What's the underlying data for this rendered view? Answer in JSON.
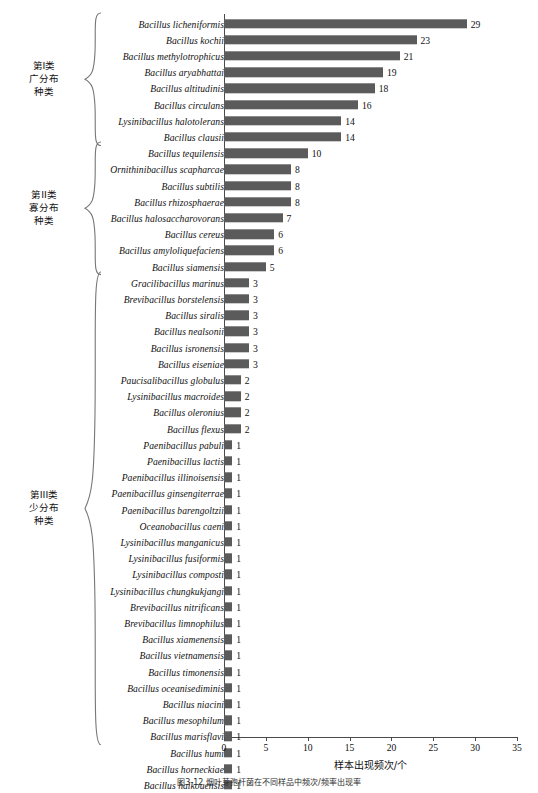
{
  "figure": {
    "caption": "图3-12  烟叶芽孢杆菌在不同样品中频次/频率出现率",
    "xlabel": "样本出现频次/个",
    "bar_color": "#5b5b5b",
    "axis_color": "#4a4a4a"
  },
  "groups": [
    {
      "id": "group-1",
      "label": "第I类\n广分布\n种类",
      "start_index": 0,
      "end_index": 7
    },
    {
      "id": "group-2",
      "label": "第II类\n寡分布\n种类",
      "start_index": 8,
      "end_index": 15
    },
    {
      "id": "group-3",
      "label": "第III类\n少分布\n种类",
      "start_index": 16,
      "end_index": 44
    }
  ],
  "chart_data": {
    "type": "bar",
    "orientation": "horizontal",
    "title": "",
    "xlabel": "样本出现频次/个",
    "ylabel": "",
    "xlim": [
      0,
      35
    ],
    "ticks": [
      0,
      5,
      10,
      15,
      20,
      25,
      30,
      35
    ],
    "grid": false,
    "legend": null,
    "categories": [
      "Bacillus licheniformis",
      "Bacillus kochii",
      "Bacillus methylotrophicus",
      "Bacillus aryabhattai",
      "Bacillus altitudinis",
      "Bacillus circulans",
      "Lysinibacillus halotolerans",
      "Bacillus clausii",
      "Bacillus tequilensis",
      "Ornithinibacillus scapharcae",
      "Bacillus subtilis",
      "Bacillus rhizosphaerae",
      "Bacillus halosaccharovorans",
      "Bacillus cereus",
      "Bacillus amyloliquefaciens",
      "Bacillus siamensis",
      "Gracilibacillus marinus",
      "Brevibacillus borstelensis",
      "Bacillus siralis",
      "Bacillus nealsonii",
      "Bacillus isronensis",
      "Bacillus eiseniae",
      "Paucisalibacillus globulus",
      "Lysinibacillus macroides",
      "Bacillus oleronius",
      "Bacillus flexus",
      "Paenibacillus pabuli",
      "Paenibacillus lactis",
      "Paenibacillus illinoisensis",
      "Paenibacillus ginsengiterrae",
      "Paenibacillus barengoltzii",
      "Oceanobacillus caeni",
      "Lysinibacillus manganicus",
      "Lysinibacillus fusiformis",
      "Lysinibacillus composti",
      "Lysinibacillus chungkukjangi",
      "Brevibacillus nitrificans",
      "Brevibacillus limnophilus",
      "Bacillus xiamenensis",
      "Bacillus vietnamensis",
      "Bacillus timonensis",
      "Bacillus oceanisediminis",
      "Bacillus niacini",
      "Bacillus mesophilum",
      "Bacillus marisflavi",
      "Bacillus humi",
      "Bacillus horneckiae",
      "Bacillus haikouensis"
    ],
    "values": [
      29,
      23,
      21,
      19,
      18,
      16,
      14,
      14,
      10,
      8,
      8,
      8,
      7,
      6,
      6,
      5,
      3,
      3,
      3,
      3,
      3,
      3,
      2,
      2,
      2,
      2,
      1,
      1,
      1,
      1,
      1,
      1,
      1,
      1,
      1,
      1,
      1,
      1,
      1,
      1,
      1,
      1,
      1,
      1,
      1,
      1,
      1,
      1
    ]
  }
}
